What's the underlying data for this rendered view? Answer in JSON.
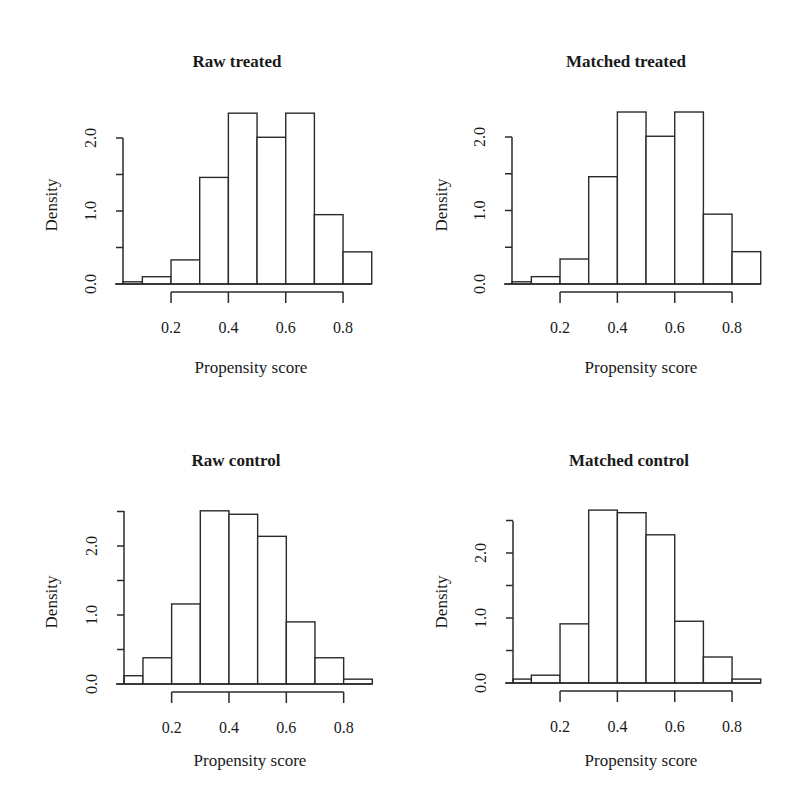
{
  "figure": {
    "panels_layout": "2x2",
    "colors": {
      "bar_fill": "#ffffff",
      "bar_stroke": "#2a2a2a",
      "text": "#1a1a1a",
      "background": "#ffffff"
    }
  },
  "chart_data": [
    {
      "type": "bar",
      "subtype": "histogram",
      "title": "Raw treated",
      "xlabel": "Propensity score",
      "ylabel": "Density",
      "bin_edges": [
        0.033,
        0.1,
        0.2,
        0.3,
        0.4,
        0.5,
        0.6,
        0.7,
        0.8,
        0.9
      ],
      "values": [
        0.03,
        0.1,
        0.33,
        1.46,
        2.34,
        2.01,
        2.34,
        0.95,
        0.44
      ],
      "x_ticks": [
        0.2,
        0.4,
        0.6,
        0.8
      ],
      "x_tick_labels": [
        "0.2",
        "0.4",
        "0.6",
        "0.8"
      ],
      "y_ticks": [
        0.0,
        0.5,
        1.0,
        1.5,
        2.0
      ],
      "y_tick_labels": [
        "0.0",
        "",
        "1.0",
        "",
        "2.0"
      ],
      "ylim": [
        0,
        2.34
      ],
      "grid": false,
      "legend": null,
      "layout": {
        "left": 0,
        "top": 0,
        "axis_x0": 123,
        "x_per_unit": 286.7,
        "x_zero_px": 113.7,
        "baseline_y": 284,
        "y_per_unit": 73,
        "axis_top_y": 138,
        "xaxis_y": 292,
        "xaxis_from": 0.2,
        "xaxis_to": 0.8
      }
    },
    {
      "type": "bar",
      "subtype": "histogram",
      "title": "Matched treated",
      "xlabel": "Propensity score",
      "ylabel": "Density",
      "bin_edges": [
        0.033,
        0.1,
        0.2,
        0.3,
        0.4,
        0.5,
        0.6,
        0.7,
        0.8,
        0.9
      ],
      "values": [
        0.03,
        0.1,
        0.34,
        1.46,
        2.34,
        2.01,
        2.34,
        0.95,
        0.44
      ],
      "x_ticks": [
        0.2,
        0.4,
        0.6,
        0.8
      ],
      "x_tick_labels": [
        "0.2",
        "0.4",
        "0.6",
        "0.8"
      ],
      "y_ticks": [
        0.0,
        0.5,
        1.0,
        1.5,
        2.0
      ],
      "y_tick_labels": [
        "0.0",
        "",
        "1.0",
        "",
        "2.0"
      ],
      "ylim": [
        0,
        2.34
      ],
      "grid": false,
      "legend": null,
      "layout": {
        "left": 390,
        "top": 0,
        "axis_x0": 512,
        "x_per_unit": 286.7,
        "x_zero_px": 502.7,
        "baseline_y": 284,
        "y_per_unit": 73.5,
        "axis_top_y": 137,
        "xaxis_y": 292,
        "xaxis_from": 0.2,
        "xaxis_to": 0.8
      }
    },
    {
      "type": "bar",
      "subtype": "histogram",
      "title": "Raw control",
      "xlabel": "Propensity score",
      "ylabel": "Density",
      "bin_edges": [
        0.033,
        0.1,
        0.2,
        0.3,
        0.4,
        0.5,
        0.6,
        0.7,
        0.8,
        0.9
      ],
      "values": [
        0.12,
        0.38,
        1.16,
        2.51,
        2.46,
        2.14,
        0.9,
        0.38,
        0.07
      ],
      "x_ticks": [
        0.2,
        0.4,
        0.6,
        0.8
      ],
      "x_tick_labels": [
        "0.2",
        "0.4",
        "0.6",
        "0.8"
      ],
      "y_ticks": [
        0.0,
        0.5,
        1.0,
        1.5,
        2.0,
        2.5
      ],
      "y_tick_labels": [
        "0.0",
        "",
        "1.0",
        "",
        "2.0",
        ""
      ],
      "ylim": [
        0,
        2.51
      ],
      "grid": false,
      "legend": null,
      "layout": {
        "left": 0,
        "top": 400,
        "axis_x0": 124,
        "x_per_unit": 286.7,
        "x_zero_px": 114.3,
        "baseline_y": 684,
        "y_per_unit": 69,
        "axis_top_y": 511,
        "xaxis_y": 692,
        "xaxis_from": 0.2,
        "xaxis_to": 0.8
      }
    },
    {
      "type": "bar",
      "subtype": "histogram",
      "title": "Matched control",
      "xlabel": "Propensity score",
      "ylabel": "Density",
      "bin_edges": [
        0.033,
        0.1,
        0.2,
        0.3,
        0.4,
        0.5,
        0.6,
        0.7,
        0.8,
        0.9
      ],
      "values": [
        0.06,
        0.12,
        0.91,
        2.66,
        2.62,
        2.28,
        0.95,
        0.4,
        0.06
      ],
      "x_ticks": [
        0.2,
        0.4,
        0.6,
        0.8
      ],
      "x_tick_labels": [
        "0.2",
        "0.4",
        "0.6",
        "0.8"
      ],
      "y_ticks": [
        0.0,
        0.5,
        1.0,
        1.5,
        2.0,
        2.5
      ],
      "y_tick_labels": [
        "0.0",
        "",
        "1.0",
        "",
        "2.0",
        ""
      ],
      "ylim": [
        0,
        2.66
      ],
      "grid": false,
      "legend": null,
      "layout": {
        "left": 390,
        "top": 400,
        "axis_x0": 513,
        "x_per_unit": 286.7,
        "x_zero_px": 502.7,
        "baseline_y": 683,
        "y_per_unit": 65,
        "axis_top_y": 521,
        "xaxis_y": 691,
        "xaxis_from": 0.2,
        "xaxis_to": 0.8
      }
    }
  ]
}
